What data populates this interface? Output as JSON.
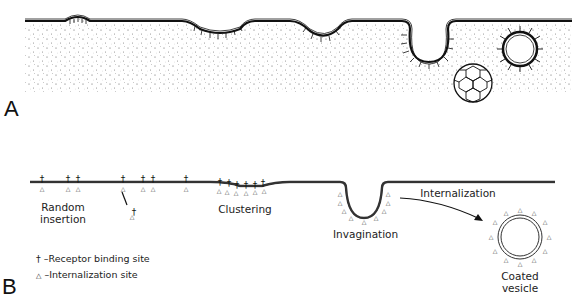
{
  "panel_a": {
    "letter": "A",
    "stages": [
      "clustering",
      "shallow-pit",
      "coated-pit",
      "coated-vesicle",
      "clathrin-cage"
    ]
  },
  "panel_b": {
    "letter": "B",
    "labels": {
      "random_insertion_l1": "Random",
      "random_insertion_l2": "insertion",
      "clustering": "Clustering",
      "invagination": "Invagination",
      "internalization": "Internalization",
      "coated_vesicle_l1": "Coated",
      "coated_vesicle_l2": "vesicle"
    },
    "legend": {
      "receptor_symbol": "†",
      "receptor_text": "–Receptor binding site",
      "internalization_symbol": "△",
      "internalization_text": "–Internalization site"
    }
  }
}
